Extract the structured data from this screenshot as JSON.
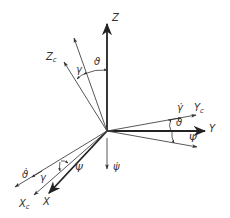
{
  "diagram": {
    "type": "coordinate-frame-rotation",
    "origin": [
      107,
      131
    ],
    "colors": {
      "line": "#333333",
      "thin_line": "#555555",
      "background": "#ffffff"
    },
    "axes": [
      {
        "id": "Z",
        "label": "Z",
        "sub": "",
        "tip": [
          107,
          22
        ],
        "bold": true
      },
      {
        "id": "Y",
        "label": "Y",
        "sub": "",
        "tip": [
          207,
          131
        ],
        "bold": true
      },
      {
        "id": "X",
        "label": "X",
        "sub": "",
        "tip": [
          48,
          194
        ],
        "bold": true
      },
      {
        "id": "Zc",
        "label": "Z",
        "sub": "c",
        "tip": [
          63,
          60
        ],
        "bold": false
      },
      {
        "id": "Yc",
        "label": "Y",
        "sub": "c",
        "tip": [
          198,
          115
        ],
        "bold": false
      },
      {
        "id": "Xc",
        "label": "X",
        "sub": "c",
        "tip": [
          33,
          196
        ],
        "bold": false
      },
      {
        "id": "Z-theta",
        "label": "",
        "sub": "",
        "tip": [
          73,
          36
        ],
        "bold": false
      },
      {
        "id": "Y-psi",
        "label": "",
        "sub": "",
        "tip": [
          199,
          147
        ],
        "bold": false
      },
      {
        "id": "theta-dot-axis",
        "label": "",
        "sub": "",
        "tip": [
          14,
          188
        ],
        "bold": false
      },
      {
        "id": "psi-dot-axis",
        "label": "",
        "sub": "",
        "tip": [
          107,
          170
        ],
        "bold": false
      }
    ],
    "labels": {
      "Z": "Z",
      "Y": "Y",
      "X": "X",
      "Zc_main": "Z",
      "Zc_sub": "c",
      "Yc_main": "Y",
      "Yc_sub": "c",
      "Xc_main": "X",
      "Xc_sub": "c",
      "theta_top": "ϑ",
      "gamma_top": "γ",
      "gamma_dot": "γ̇",
      "theta_right": "ϑ",
      "psi_right": "Ψ",
      "psi_dot": "ψ̇",
      "theta_dot": "ϑ̇",
      "gamma_bottom": "γ",
      "psi_bottom": "Ψ"
    }
  }
}
